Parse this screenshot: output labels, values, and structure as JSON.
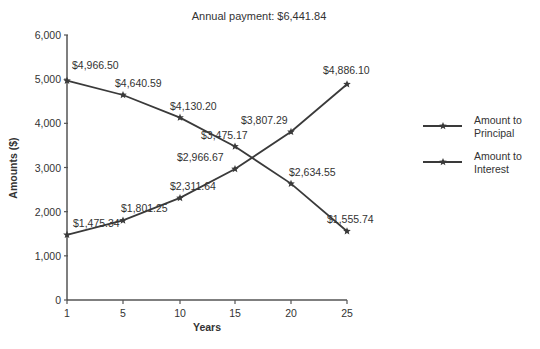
{
  "chart_data": {
    "type": "line",
    "title": "Annual payment: $6,441.84",
    "xlabel": "Years",
    "ylabel": "Amounts ($)",
    "x": [
      1,
      5,
      10,
      15,
      20,
      25
    ],
    "x_tick_labels": [
      "1",
      "5",
      "10",
      "15",
      "20",
      "25"
    ],
    "y_ticks": [
      0,
      1000,
      2000,
      3000,
      4000,
      5000,
      6000
    ],
    "y_tick_labels": [
      "0",
      "1,000",
      "2,000",
      "3,000",
      "4,000",
      "5,000",
      "6,000"
    ],
    "ylim": [
      0,
      6000
    ],
    "grid": false,
    "legend_position": "right",
    "series": [
      {
        "name": "Amount to Principal",
        "legend_lines": [
          "Amount to",
          "Principal"
        ],
        "values": [
          1475.34,
          1801.25,
          2311.64,
          2966.67,
          3807.29,
          4886.1
        ],
        "labels": [
          "$1,475.34",
          "$1,801.25",
          "$2,311.64",
          "$2,966.67",
          "$3,807.29",
          "$4,886.10"
        ],
        "label_offsets": [
          [
            6,
            -8
          ],
          [
            -2,
            -8
          ],
          [
            -10,
            -8
          ],
          [
            -58,
            -8
          ],
          [
            -50,
            -8
          ],
          [
            -24,
            -10
          ]
        ]
      },
      {
        "name": "Amount to Interest",
        "legend_lines": [
          "Amount to",
          "Interest"
        ],
        "values": [
          4966.5,
          4640.59,
          4130.2,
          3475.17,
          2634.55,
          1555.74
        ],
        "labels": [
          "$4,966.50",
          "$4,640.59",
          "$4,130.20",
          "$3,475.17",
          "$2,634.55",
          "$1,555.74"
        ],
        "label_offsets": [
          [
            5,
            -12
          ],
          [
            -8,
            -8
          ],
          [
            -10,
            -8
          ],
          [
            -34,
            -8
          ],
          [
            -2,
            -8
          ],
          [
            -20,
            -8
          ]
        ]
      }
    ],
    "colors": {
      "line": "#3a3a3a",
      "axis": "#555555",
      "text": "#333333"
    }
  }
}
